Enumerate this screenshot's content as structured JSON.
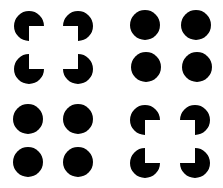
{
  "figure": {
    "background": "#ffffff",
    "ink": "#000000",
    "radius": 15,
    "groups": [
      {
        "name": "top-left",
        "type": "pacman",
        "shapes": [
          {
            "cx": 29,
            "cy": 26,
            "missing": "bottom-right"
          },
          {
            "cx": 78,
            "cy": 26,
            "missing": "bottom-left"
          },
          {
            "cx": 29,
            "cy": 69,
            "missing": "top-right"
          },
          {
            "cx": 78,
            "cy": 69,
            "missing": "top-left"
          }
        ]
      },
      {
        "name": "top-right",
        "type": "disc",
        "shapes": [
          {
            "cx": 145,
            "cy": 25
          },
          {
            "cx": 196,
            "cy": 25
          },
          {
            "cx": 146,
            "cy": 67
          },
          {
            "cx": 197,
            "cy": 67
          }
        ]
      },
      {
        "name": "bottom-left",
        "type": "disc",
        "shapes": [
          {
            "cx": 28,
            "cy": 119
          },
          {
            "cx": 78,
            "cy": 119
          },
          {
            "cx": 28,
            "cy": 162
          },
          {
            "cx": 78,
            "cy": 162
          }
        ]
      },
      {
        "name": "bottom-right",
        "type": "pacman",
        "shapes": [
          {
            "cx": 145,
            "cy": 120,
            "missing": "bottom-right"
          },
          {
            "cx": 195,
            "cy": 120,
            "missing": "bottom-left"
          },
          {
            "cx": 145,
            "cy": 163,
            "missing": "top-right"
          },
          {
            "cx": 195,
            "cy": 163,
            "missing": "top-left"
          }
        ]
      }
    ]
  }
}
